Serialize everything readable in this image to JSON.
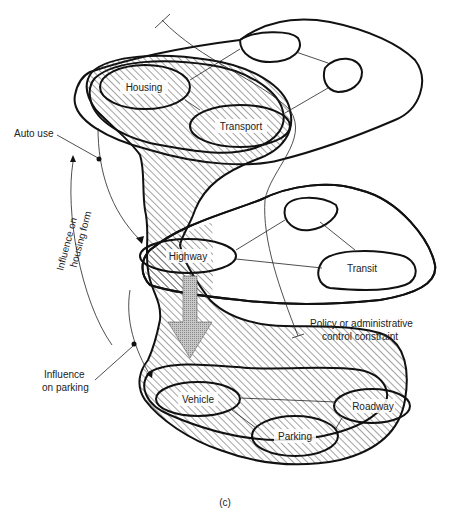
{
  "diagram": {
    "caption": "(c)",
    "hatched_domain_nodes": {
      "upper": [
        "Housing",
        "Transport"
      ],
      "middle": [
        "Highway"
      ],
      "lower": [
        "Vehicle",
        "Parking",
        "Roadway"
      ]
    },
    "unhatched_nodes": {
      "upper_right": [
        "",
        ""
      ],
      "middle_right": [
        "",
        "Transit"
      ]
    },
    "annotations": {
      "auto_use": "Auto use",
      "influence_housing_line1": "Influence on",
      "influence_housing_line2": "housing form",
      "influence_parking_line1": "Influence",
      "influence_parking_line2": "on parking",
      "policy_line1": "Policy or administrative",
      "policy_line2": "control constraint"
    },
    "colors": {
      "line": "#111111",
      "hatch": "#333333",
      "arrow_fill": "#bdbdbd",
      "background": "#ffffff"
    }
  }
}
